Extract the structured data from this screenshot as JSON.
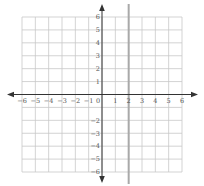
{
  "chart_data": {
    "type": "line",
    "title": "",
    "xlabel": "",
    "ylabel": "",
    "xlim": [
      -6,
      6
    ],
    "ylim": [
      -6,
      6
    ],
    "grid": true,
    "x_ticks": [
      "-6",
      "-5",
      "-4",
      "-3",
      "-2",
      "-1",
      "0",
      "1",
      "2",
      "3",
      "4",
      "5",
      "6"
    ],
    "y_ticks": [
      "6",
      "5",
      "4",
      "3",
      "2",
      "1",
      "-2",
      "-3",
      "-4",
      "-5",
      "-6"
    ],
    "series": [
      {
        "name": "x = 2",
        "equation": "x = 2",
        "orientation": "vertical",
        "x": 2,
        "color": "#a9a9a9"
      }
    ],
    "colors": {
      "grid": "#c8c8c8",
      "axes": "#333333",
      "line": "#a9a9a9"
    }
  }
}
